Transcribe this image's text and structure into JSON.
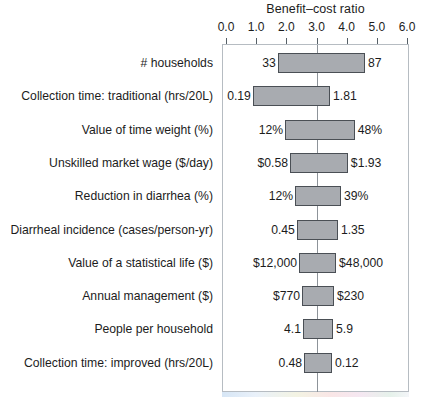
{
  "chart_data": {
    "type": "bar",
    "subtype": "tornado",
    "title": "Benefit–cost ratio",
    "xlabel": "",
    "ylabel": "",
    "xlim": [
      0.0,
      6.0
    ],
    "xticks": [
      "0.0",
      "1.0",
      "2.0",
      "3.0",
      "4.0",
      "5.0",
      "6.0"
    ],
    "xtick_values": [
      0.0,
      1.0,
      2.0,
      3.0,
      4.0,
      5.0,
      6.0
    ],
    "grid": false,
    "legend": "none",
    "baseline": 3.1,
    "categories": [
      "# households",
      "Collection time: traditional (hrs/20L)",
      "Value of time weight (%)",
      "Unskilled market wage ($/day)",
      "Reduction in diarrhea (%)",
      "Diarrheal incidence (cases/person-yr)",
      "Value of a statistical life ($)",
      "Annual management ($)",
      "People per household",
      "Collection time: improved (hrs/20L)"
    ],
    "bars": [
      {
        "label": "# households",
        "low_label": "33",
        "high_label": "87",
        "low_ratio": 1.72,
        "high_ratio": 4.61
      },
      {
        "label": "Collection time: traditional (hrs/20L)",
        "low_label": "0.19",
        "high_label": "1.81",
        "low_ratio": 0.89,
        "high_ratio": 3.45
      },
      {
        "label": "Value of time weight (%)",
        "low_label": "12%",
        "high_label": "48%",
        "low_ratio": 1.96,
        "high_ratio": 4.27
      },
      {
        "label": "Unskilled market wage ($/day)",
        "low_label": "$0.58",
        "high_label": "$1.93",
        "low_ratio": 2.12,
        "high_ratio": 4.04
      },
      {
        "label": "Reduction in diarrhea (%)",
        "low_label": "12%",
        "high_label": "39%",
        "low_ratio": 2.29,
        "high_ratio": 3.81
      },
      {
        "label": "Diarrheal incidence (cases/person-yr)",
        "low_label": "0.45",
        "high_label": "1.35",
        "low_ratio": 2.35,
        "high_ratio": 3.71
      },
      {
        "label": "Value of a statistical life ($)",
        "low_label": "$12,000",
        "high_label": "$48,000",
        "low_ratio": 2.42,
        "high_ratio": 3.65
      },
      {
        "label": "Annual management ($)",
        "low_label": "$770",
        "high_label": "$230",
        "low_ratio": 2.52,
        "high_ratio": 3.58
      },
      {
        "label": "People per household",
        "low_label": "4.1",
        "high_label": "5.9",
        "low_ratio": 2.55,
        "high_ratio": 3.55
      },
      {
        "label": "Collection time: improved (hrs/20L)",
        "low_label": "0.48",
        "high_label": "0.12",
        "low_ratio": 2.59,
        "high_ratio": 3.51
      }
    ],
    "colors": {
      "bar_fill": "#a8abb0",
      "bar_edge": "#4a4f55",
      "axis": "#555f66",
      "frame": "#b6bcc2",
      "baseline": "#8d9399",
      "text": "#1c1c1c",
      "background": "#ffffff"
    }
  }
}
